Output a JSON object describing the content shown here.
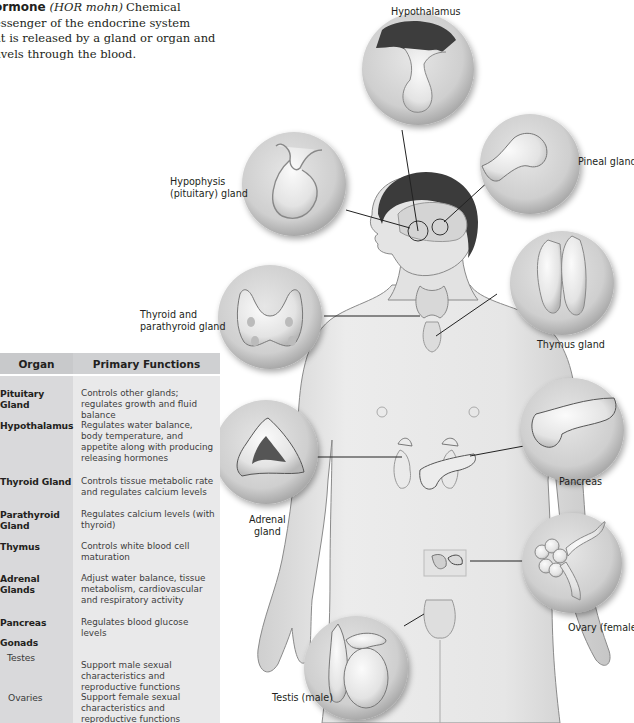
{
  "glossary": {
    "term": "ormone",
    "pronunciation": "(HOR mohn)",
    "definition_line1": "Chemical",
    "definition_lines": [
      "essenger of the endocrine system",
      "at is released by a gland or organ and",
      "avels through the blood."
    ]
  },
  "table": {
    "headers": {
      "organ": "Organ",
      "functions": "Primary Functions"
    },
    "rows": [
      {
        "organ": "Pituitary Gland",
        "function": "Controls other glands; regulates growth and fluid balance"
      },
      {
        "organ": "Hypothalamus",
        "function": "Regulates water balance, body temperature, and appetite along with producing releasing hormones"
      },
      {
        "organ": "Thyroid Gland",
        "function": "Controls tissue metabolic rate and regulates calcium levels"
      },
      {
        "organ": "Parathyroid Gland",
        "function": "Regulates calcium levels (with thyroid)"
      },
      {
        "organ": "Thymus",
        "function": "Controls white blood cell maturation"
      },
      {
        "organ": "Adrenal Glands",
        "function": "Adjust water balance, tissue metabolism, cardiovascular and respiratory activity"
      },
      {
        "organ": "Pancreas",
        "function": "Regulates blood glucose levels"
      },
      {
        "organ": "Gonads",
        "function": ""
      },
      {
        "organ": "Testes",
        "function": "Support male sexual characteristics and reproductive functions",
        "sub": true
      },
      {
        "organ": "Ovaries",
        "function": "Support female sexual characteristics and reproductive functions",
        "sub": true
      }
    ]
  },
  "diagram": {
    "labels": {
      "hypothalamus": "Hypothalamus",
      "pineal": "Pineal gland",
      "hypophysis_line1": "Hypophysis",
      "hypophysis_line2": "(pituitary) gland",
      "thyroid_line1": "Thyroid and",
      "thyroid_line2": "parathyroid gland",
      "thymus": "Thymus gland",
      "pancreas": "Pancreas",
      "adrenal_line1": "Adrenal",
      "adrenal_line2": "gland",
      "ovary": "Ovary (female)",
      "testis": "Testis (male)"
    }
  }
}
